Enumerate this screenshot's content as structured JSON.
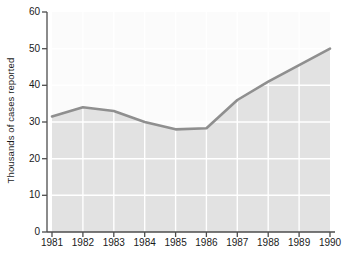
{
  "chart_data": {
    "type": "area",
    "title": "",
    "xlabel": "",
    "ylabel": "Thousands of cases reported",
    "categories": [
      "1981",
      "1982",
      "1983",
      "1984",
      "1985",
      "1986",
      "1987",
      "1988",
      "1989",
      "1990"
    ],
    "values": [
      31.5,
      34,
      33,
      30,
      28,
      28.3,
      36,
      41,
      45.5,
      50
    ],
    "series": [
      {
        "name": "Cases reported",
        "values": [
          31.5,
          34,
          33,
          30,
          28,
          28.3,
          36,
          41,
          45.5,
          50
        ]
      }
    ],
    "ylim": [
      0,
      60
    ],
    "yticks": [
      0,
      10,
      20,
      30,
      40,
      50,
      60
    ],
    "ytick_labels": [
      "0",
      "10",
      "20",
      "30",
      "40",
      "50",
      "60"
    ],
    "xtick_labels": [
      "1981",
      "1982",
      "1983",
      "1984",
      "1985",
      "1986",
      "1987",
      "1988",
      "1989",
      "1990"
    ],
    "grid": true,
    "legend": "none",
    "line_color": "#8f8f8f",
    "fill_color": "#e2e2e2",
    "plot_background": "#fbfbfb",
    "grid_color": "#ffffff",
    "axis_color": "#4d4d4d",
    "text_color": "#1a1a1a"
  }
}
